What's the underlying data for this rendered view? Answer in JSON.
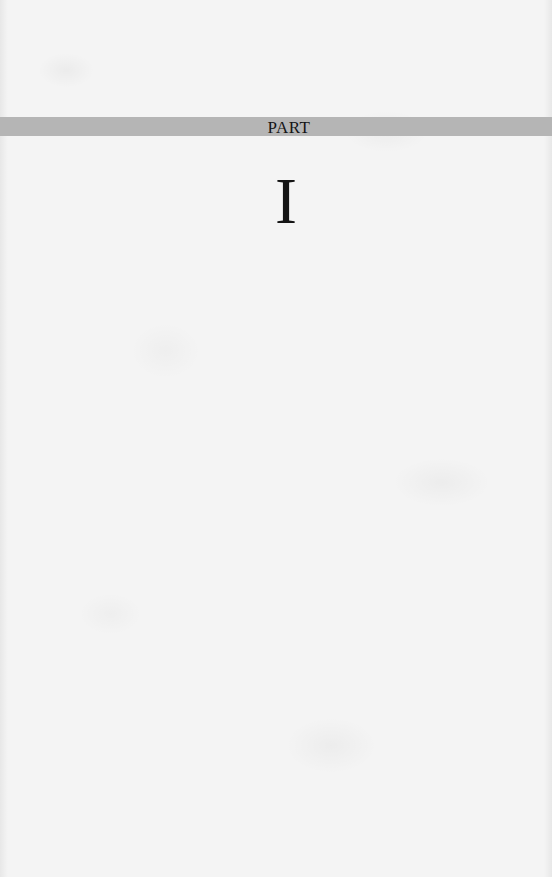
{
  "page": {
    "type": "part-title-page",
    "background_color": "#f4f4f4"
  },
  "part_band": {
    "label": "PART",
    "band_color": "#b5b5b5",
    "text_color": "#151515"
  },
  "part_number": {
    "value": "I",
    "text_color": "#141414"
  }
}
